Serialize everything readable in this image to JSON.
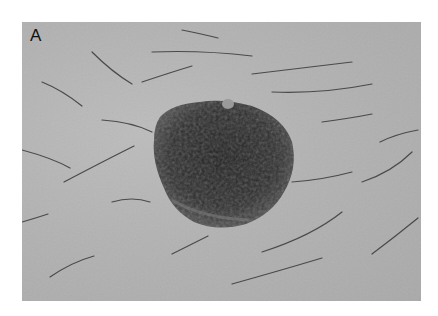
{
  "figure": {
    "panel_label": "A",
    "colors": {
      "background": "#ffffff",
      "skin": "#b2b2b2",
      "lesion": "#2a2a2a",
      "hair": "#4a4a4a"
    }
  }
}
